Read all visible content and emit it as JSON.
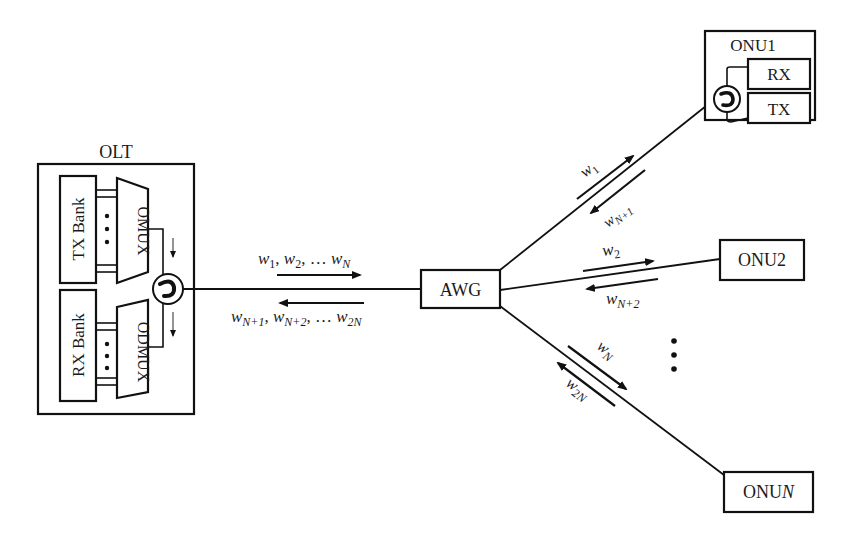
{
  "diagram": {
    "type": "WDM-PON architecture",
    "colors": {
      "stroke": "#111111",
      "text": "#1a1a1a",
      "background": "#ffffff"
    },
    "olt": {
      "title": "OLT",
      "tx_bank": "TX Bank",
      "rx_bank": "RX Bank",
      "mux": "OMUX",
      "demux": "ODMUX",
      "circulator": "circulator-icon"
    },
    "awg": {
      "label": "AWG"
    },
    "feeder": {
      "downstream": {
        "w": "w",
        "s1": "1",
        "sep1": ", ",
        "s2": "2",
        "sep2": ", … ",
        "sN": "N"
      },
      "upstream": {
        "w": "w",
        "s1": "N+1",
        "sep1": ", ",
        "s2": "N+2",
        "sep2": ", … ",
        "sN": "2N"
      }
    },
    "onus": [
      {
        "label": "ONU1",
        "rx": "RX",
        "tx": "TX",
        "down_w": "w",
        "down_sub": "1",
        "up_w": "w",
        "up_sub": "N+1"
      },
      {
        "label": "ONU2",
        "down_w": "w",
        "down_sub": "2",
        "up_w": "w",
        "up_sub": "N+2"
      },
      {
        "label_prefix": "ONU",
        "label_italic": "N",
        "down_w": "w",
        "down_sub": "N",
        "up_w": "w",
        "up_sub": "2N"
      }
    ],
    "ellipsis": "⋮"
  }
}
